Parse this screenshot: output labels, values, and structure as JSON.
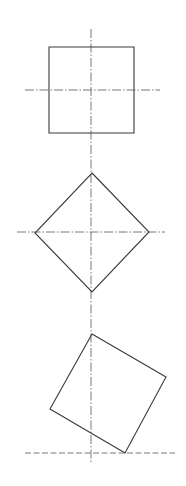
{
  "diagram": {
    "colors": {
      "background": "#ffffff",
      "stroke": "#3a3a3a",
      "axis": "#555555"
    },
    "vertical_axis": {
      "x": 91,
      "y1": 29,
      "y2": 463
    },
    "figures": [
      {
        "name": "upright-square",
        "points": "49,47 134,47 134,133 49,133",
        "h_axis": {
          "x1": 25,
          "x2": 160,
          "y": 90
        }
      },
      {
        "name": "diamond-square",
        "points": "92,173 149,232 92,292 35,233",
        "h_axis": {
          "x1": 17,
          "x2": 165,
          "y": 232
        }
      },
      {
        "name": "tilted-square",
        "points": "92,334 166,377 125,453 50,409",
        "baseline": {
          "x1": 25,
          "x2": 175,
          "y": 453
        }
      }
    ]
  }
}
